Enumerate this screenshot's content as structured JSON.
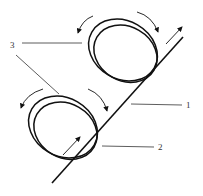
{
  "diagram": {
    "type": "mechanical schematic",
    "labels": {
      "one": "1",
      "two": "2",
      "three": "3"
    },
    "components": [
      {
        "id": "1",
        "name": "inclined strip / line"
      },
      {
        "id": "2",
        "name": "lower ring"
      },
      {
        "id": "3",
        "name": "rings (leader to both)"
      }
    ],
    "colors": {
      "stroke": "#111111",
      "leader": "#333333",
      "background": "#ffffff"
    }
  }
}
